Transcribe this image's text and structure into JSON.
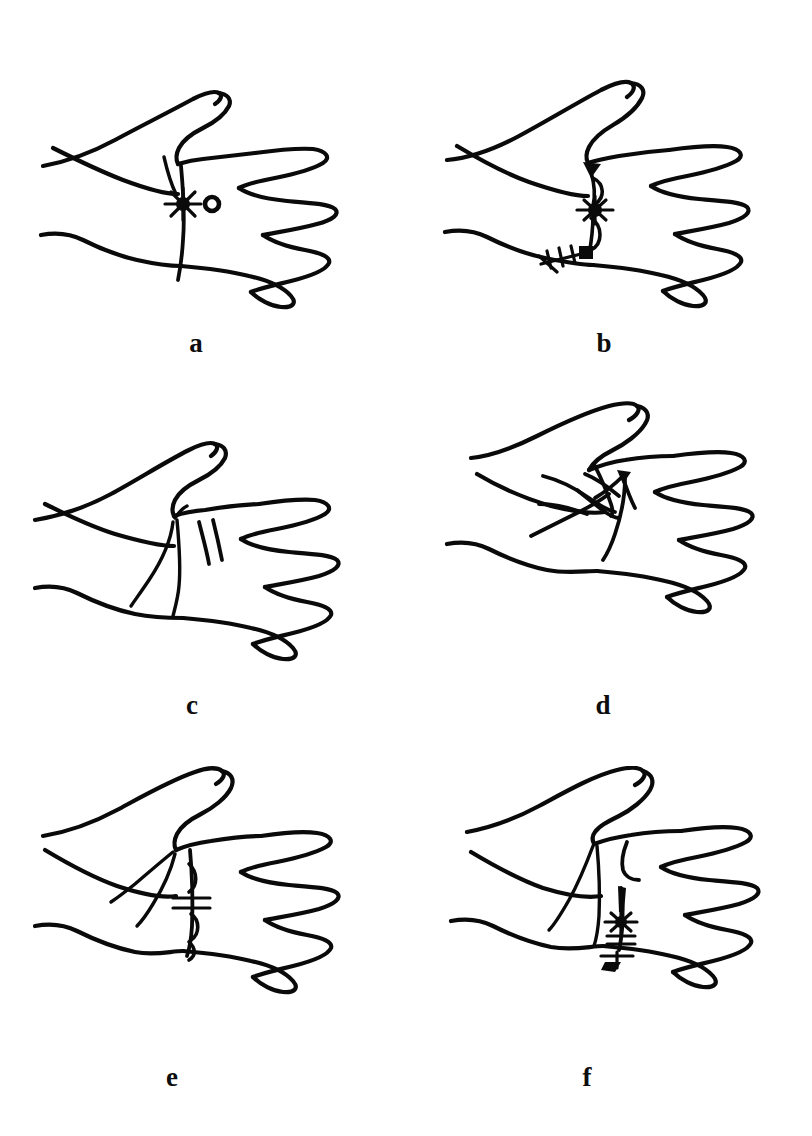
{
  "figure": {
    "background_color": "#ffffff",
    "ink_color": "#0a0a0a",
    "layout": "2 columns x 3 rows",
    "panel_count": 6
  },
  "panels": [
    {
      "id": "a",
      "label": "a",
      "view": "palmar view of right hand, thumb at upper left, four fingers at right",
      "markings": "single straight longitudinal incision line across the first web space with a star/asterisk knot mark and a small open circle beside it"
    },
    {
      "id": "b",
      "label": "b",
      "view": "palmar view of right hand, thumb at upper left, four fingers at right",
      "markings": "Z-plasty style suture line with a solid triangular flap tip, two elongated loop stitches, a central star knot and a cross-hatched suture tail at the distal palmar crease"
    },
    {
      "id": "c",
      "label": "c",
      "view": "palmar view of right hand, thumb at upper left, four fingers at right",
      "markings": "two short parallel incision marks in the web space plus two long curved palmar creases, no sutures"
    },
    {
      "id": "d",
      "label": "d",
      "view": "palmar view of right hand, thumb at upper left, four fingers at right",
      "markings": "raised triangular transposition flaps drawn over the thenar area with radiating flap limbs converging at the web space"
    },
    {
      "id": "e",
      "label": "e",
      "view": "palmar view of right hand, thumb at upper left, four fingers at right",
      "markings": "vertical suture line with three loop stitches and a horizontal cross ladder stitch at mid-line, with two thenar crease lines"
    },
    {
      "id": "f",
      "label": "f",
      "view": "palmar view of right hand, thumb at upper left, four fingers at right",
      "markings": "vertical closure line with an elongated dart, a star knot, short cross stitches and a terminal T-shaped stitch at the palmar crease, plus a small hook-shaped flap mark"
    }
  ],
  "icons": {
    "star_knot": "star-knot-icon",
    "loop_stitch": "loop-stitch-icon",
    "cross_stitch": "cross-stitch-icon",
    "open_circle": "open-circle-icon"
  }
}
